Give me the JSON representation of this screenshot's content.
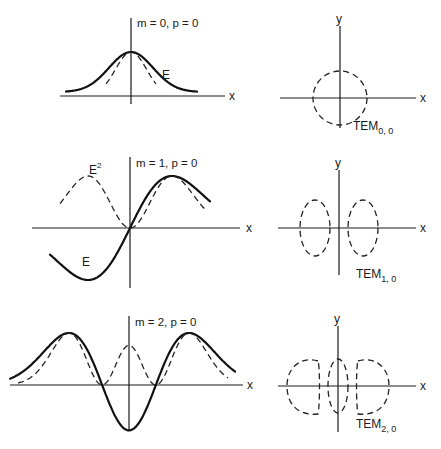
{
  "rows": [
    {
      "mode_label": "m = 0, p = 0",
      "field_label": "E",
      "intensity_label": "",
      "x_axis_label": "x",
      "pattern_x_label": "x",
      "pattern_y_label": "y",
      "pattern_name": "TEM",
      "pattern_sub": "0, 0",
      "order": 0
    },
    {
      "mode_label": "m = 1, p = 0",
      "field_label": "E",
      "intensity_label": "E",
      "intensity_sup": "2",
      "x_axis_label": "x",
      "pattern_x_label": "x",
      "pattern_y_label": "y",
      "pattern_name": "TEM",
      "pattern_sub": "1, 0",
      "order": 1
    },
    {
      "mode_label": "m = 2, p = 0",
      "field_label": "",
      "intensity_label": "",
      "x_axis_label": "x",
      "pattern_x_label": "x",
      "pattern_y_label": "y",
      "pattern_name": "TEM",
      "pattern_sub": "2, 0",
      "order": 2
    }
  ],
  "legend": {
    "solid_curve": "Field amplitude E",
    "dashed_curve": "Intensity E²"
  }
}
